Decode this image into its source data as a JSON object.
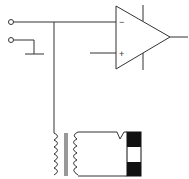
{
  "diagram": {
    "title": "",
    "components": [
      {
        "id": "terminal-1",
        "type": "input-terminal"
      },
      {
        "id": "terminal-2",
        "type": "input-terminal"
      },
      {
        "id": "ground",
        "type": "ground"
      },
      {
        "id": "op-amp",
        "type": "operational-amplifier",
        "inputs": {
          "inverting": "−",
          "noninverting": "+"
        }
      },
      {
        "id": "transformer",
        "type": "transformer"
      },
      {
        "id": "sensor-block",
        "type": "load-block"
      }
    ],
    "labels": {
      "minus": "−",
      "plus": "+"
    },
    "colors": {
      "line": "#333333",
      "fill_dark": "#111111",
      "background": "#ffffff"
    }
  }
}
